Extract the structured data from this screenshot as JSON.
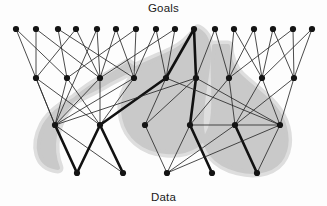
{
  "figure": {
    "top_label": "Goals",
    "bottom_label": "Data",
    "colors": {
      "node": "#141414",
      "edge": "#2b2b2b",
      "edge_bold": "#111111",
      "region": "#c9c9c9",
      "region_soft": "#dedede",
      "background": "#fdfdfd",
      "text": "#1a1a1a"
    }
  },
  "chart_data": {
    "type": "diagram",
    "layers": [
      {
        "name": "goals",
        "y": 29,
        "count": 16
      },
      {
        "name": "middle_upper",
        "y": 78,
        "count": 9
      },
      {
        "name": "middle_lower",
        "y": 125,
        "count": 6
      },
      {
        "name": "data",
        "y": 173,
        "count": 5
      }
    ],
    "nodes": [
      {
        "id": "g0",
        "layer": "goals",
        "x": 16,
        "y": 29
      },
      {
        "id": "g1",
        "layer": "goals",
        "x": 36,
        "y": 29
      },
      {
        "id": "g2",
        "layer": "goals",
        "x": 58,
        "y": 29
      },
      {
        "id": "g3",
        "layer": "goals",
        "x": 76,
        "y": 29
      },
      {
        "id": "g4",
        "layer": "goals",
        "x": 97,
        "y": 29
      },
      {
        "id": "g5",
        "layer": "goals",
        "x": 116,
        "y": 29
      },
      {
        "id": "g6",
        "layer": "goals",
        "x": 136,
        "y": 29
      },
      {
        "id": "g7",
        "layer": "goals",
        "x": 156,
        "y": 29
      },
      {
        "id": "g8",
        "layer": "goals",
        "x": 175,
        "y": 29
      },
      {
        "id": "g9",
        "layer": "goals",
        "x": 194,
        "y": 29
      },
      {
        "id": "g10",
        "layer": "goals",
        "x": 215,
        "y": 29
      },
      {
        "id": "g11",
        "layer": "goals",
        "x": 234,
        "y": 29
      },
      {
        "id": "g12",
        "layer": "goals",
        "x": 254,
        "y": 29
      },
      {
        "id": "g13",
        "layer": "goals",
        "x": 273,
        "y": 29
      },
      {
        "id": "g14",
        "layer": "goals",
        "x": 293,
        "y": 29
      },
      {
        "id": "g15",
        "layer": "goals",
        "x": 312,
        "y": 29
      },
      {
        "id": "m0",
        "layer": "middle_upper",
        "x": 36,
        "y": 78
      },
      {
        "id": "m1",
        "layer": "middle_upper",
        "x": 67,
        "y": 78
      },
      {
        "id": "m2",
        "layer": "middle_upper",
        "x": 100,
        "y": 78
      },
      {
        "id": "m3",
        "layer": "middle_upper",
        "x": 134,
        "y": 78
      },
      {
        "id": "m4",
        "layer": "middle_upper",
        "x": 166,
        "y": 78
      },
      {
        "id": "m5",
        "layer": "middle_upper",
        "x": 196,
        "y": 78
      },
      {
        "id": "m6",
        "layer": "middle_upper",
        "x": 229,
        "y": 78
      },
      {
        "id": "m7",
        "layer": "middle_upper",
        "x": 262,
        "y": 78
      },
      {
        "id": "m8",
        "layer": "middle_upper",
        "x": 294,
        "y": 78
      },
      {
        "id": "n0",
        "layer": "middle_lower",
        "x": 55,
        "y": 125
      },
      {
        "id": "n1",
        "layer": "middle_lower",
        "x": 100,
        "y": 125
      },
      {
        "id": "n2",
        "layer": "middle_lower",
        "x": 145,
        "y": 125
      },
      {
        "id": "n3",
        "layer": "middle_lower",
        "x": 190,
        "y": 125
      },
      {
        "id": "n4",
        "layer": "middle_lower",
        "x": 235,
        "y": 125
      },
      {
        "id": "n5",
        "layer": "middle_lower",
        "x": 280,
        "y": 125
      },
      {
        "id": "d0",
        "layer": "data",
        "x": 77,
        "y": 173
      },
      {
        "id": "d1",
        "layer": "data",
        "x": 123,
        "y": 173
      },
      {
        "id": "d2",
        "layer": "data",
        "x": 167,
        "y": 173
      },
      {
        "id": "d3",
        "layer": "data",
        "x": 212,
        "y": 173
      },
      {
        "id": "d4",
        "layer": "data",
        "x": 257,
        "y": 173
      }
    ],
    "edges": [
      {
        "from": "g0",
        "to": "m1",
        "bold": false
      },
      {
        "from": "g0",
        "to": "n0",
        "bold": false
      },
      {
        "from": "g1",
        "to": "m0",
        "bold": false
      },
      {
        "from": "g1",
        "to": "m2",
        "bold": false
      },
      {
        "from": "g2",
        "to": "m1",
        "bold": false
      },
      {
        "from": "g2",
        "to": "m3",
        "bold": false
      },
      {
        "from": "g3",
        "to": "m2",
        "bold": false
      },
      {
        "from": "g3",
        "to": "m0",
        "bold": false
      },
      {
        "from": "g4",
        "to": "m2",
        "bold": false
      },
      {
        "from": "g4",
        "to": "n0",
        "bold": false
      },
      {
        "from": "g5",
        "to": "m3",
        "bold": false
      },
      {
        "from": "g5",
        "to": "m2",
        "bold": false
      },
      {
        "from": "g6",
        "to": "m3",
        "bold": false
      },
      {
        "from": "g6",
        "to": "m1",
        "bold": false
      },
      {
        "from": "g7",
        "to": "m4",
        "bold": false
      },
      {
        "from": "g7",
        "to": "m3",
        "bold": false
      },
      {
        "from": "g8",
        "to": "m4",
        "bold": false
      },
      {
        "from": "g8",
        "to": "m2",
        "bold": false
      },
      {
        "from": "g9",
        "to": "m4",
        "bold": true
      },
      {
        "from": "g9",
        "to": "m5",
        "bold": true
      },
      {
        "from": "g10",
        "to": "m5",
        "bold": false
      },
      {
        "from": "g10",
        "to": "m6",
        "bold": false
      },
      {
        "from": "g11",
        "to": "m6",
        "bold": false
      },
      {
        "from": "g11",
        "to": "m7",
        "bold": false
      },
      {
        "from": "g12",
        "to": "m6",
        "bold": false
      },
      {
        "from": "g12",
        "to": "m7",
        "bold": false
      },
      {
        "from": "g13",
        "to": "m7",
        "bold": false
      },
      {
        "from": "g13",
        "to": "m8",
        "bold": false
      },
      {
        "from": "g14",
        "to": "m8",
        "bold": false
      },
      {
        "from": "g14",
        "to": "m6",
        "bold": false
      },
      {
        "from": "g15",
        "to": "m8",
        "bold": false
      },
      {
        "from": "g15",
        "to": "m7",
        "bold": false
      },
      {
        "from": "m0",
        "to": "n0",
        "bold": false
      },
      {
        "from": "m0",
        "to": "n1",
        "bold": false
      },
      {
        "from": "m1",
        "to": "n0",
        "bold": false
      },
      {
        "from": "m1",
        "to": "n1",
        "bold": false
      },
      {
        "from": "m2",
        "to": "n0",
        "bold": false
      },
      {
        "from": "m2",
        "to": "n1",
        "bold": false
      },
      {
        "from": "m3",
        "to": "n0",
        "bold": false
      },
      {
        "from": "m3",
        "to": "n1",
        "bold": false
      },
      {
        "from": "m4",
        "to": "n1",
        "bold": true
      },
      {
        "from": "m4",
        "to": "n2",
        "bold": false
      },
      {
        "from": "m5",
        "to": "n3",
        "bold": true
      },
      {
        "from": "m5",
        "to": "n2",
        "bold": false
      },
      {
        "from": "m5",
        "to": "n5",
        "bold": false
      },
      {
        "from": "m6",
        "to": "n3",
        "bold": false
      },
      {
        "from": "m6",
        "to": "n4",
        "bold": false
      },
      {
        "from": "m7",
        "to": "n4",
        "bold": false
      },
      {
        "from": "m7",
        "to": "n5",
        "bold": false
      },
      {
        "from": "m8",
        "to": "n5",
        "bold": false
      },
      {
        "from": "m8",
        "to": "n4",
        "bold": false
      },
      {
        "from": "m4",
        "to": "n5",
        "bold": false
      },
      {
        "from": "n0",
        "to": "m5",
        "bold": false
      },
      {
        "from": "n0",
        "to": "d0",
        "bold": true
      },
      {
        "from": "n0",
        "to": "d1",
        "bold": false
      },
      {
        "from": "n1",
        "to": "d0",
        "bold": true
      },
      {
        "from": "n1",
        "to": "d1",
        "bold": true
      },
      {
        "from": "n2",
        "to": "d2",
        "bold": false
      },
      {
        "from": "n3",
        "to": "d3",
        "bold": true
      },
      {
        "from": "n3",
        "to": "d2",
        "bold": false
      },
      {
        "from": "n4",
        "to": "d4",
        "bold": true
      },
      {
        "from": "n4",
        "to": "d2",
        "bold": false
      },
      {
        "from": "n5",
        "to": "d4",
        "bold": false
      },
      {
        "from": "n5",
        "to": "d2",
        "bold": false
      },
      {
        "from": "n3",
        "to": "n5",
        "bold": false
      }
    ],
    "highlight_region": {
      "label": "shaded-arch-region",
      "description": "Light grey arch shaped region spanning both lobes under the goals layer"
    }
  }
}
